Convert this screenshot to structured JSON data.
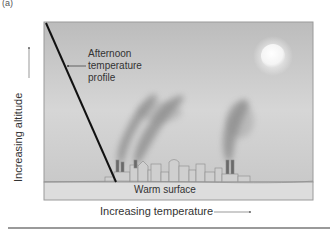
{
  "panel_label": "(a)",
  "axes": {
    "y_label": "Increasing altitude",
    "x_label": "Increasing temperature"
  },
  "annotations": {
    "profile_label_lines": [
      "Afternoon",
      "temperature",
      "profile"
    ],
    "ground_label": "Warm surface"
  },
  "colors": {
    "sky_top": "#bdbdbd",
    "sky_bottom": "#e6e6e6",
    "ground": "#dcdcdc",
    "profile_line": "#111111",
    "smoke": "#707070",
    "sun": "#fafafa"
  }
}
